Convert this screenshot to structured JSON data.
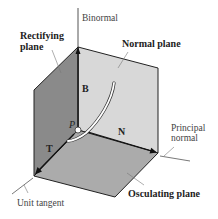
{
  "labels": {
    "binormal": "Binormal",
    "rectifying_plane": [
      "Rectifying",
      "plane"
    ],
    "normal_plane": "Normal plane",
    "principal_normal": [
      "Principal",
      "normal"
    ],
    "unit_tangent": "Unit tangent",
    "osculating_plane": "Osculating plane"
  },
  "vectors": {
    "B": "B",
    "N": "N",
    "T": "T"
  },
  "point": "P",
  "colors": {
    "normal_plane": "#d8d8d8",
    "rectifying_plane": "#8a8a8a",
    "osculating_plane": "#ababab",
    "edges": "#222222",
    "curve": "#ffffff"
  }
}
